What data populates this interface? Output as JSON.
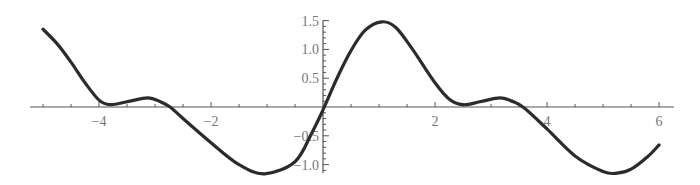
{
  "chart_data": {
    "type": "line",
    "title": "",
    "xlabel": "",
    "ylabel": "",
    "xlim": [
      -5,
      6
    ],
    "ylim": [
      -1.15,
      1.5
    ],
    "grid": false,
    "legend": null,
    "x_ticks": [
      -4,
      -2,
      2,
      4,
      6
    ],
    "x_tick_labels": [
      "−4",
      "−2",
      "2",
      "4",
      "6"
    ],
    "y_ticks": [
      -1.0,
      -0.5,
      0.5,
      1.0,
      1.5
    ],
    "y_tick_labels": [
      "−1.0",
      "−0.5",
      "0.5",
      "1.0",
      "1.5"
    ],
    "series": [
      {
        "name": "f(x)",
        "color": "#2b2b2b",
        "x": [
          -5.0,
          -4.75,
          -4.5,
          -4.25,
          -4.0,
          -3.8,
          -3.5,
          -3.13,
          -2.9,
          -2.73,
          -2.5,
          -2.0,
          -1.5,
          -1.04,
          -0.5,
          -0.2,
          0.0,
          0.25,
          0.5,
          0.75,
          1.05,
          1.3,
          1.6,
          2.0,
          2.25,
          2.5,
          2.8,
          3.16,
          3.4,
          3.6,
          4.0,
          4.5,
          5.0,
          5.25,
          5.5,
          5.8,
          6.0
        ],
        "y": [
          1.35,
          1.1,
          0.78,
          0.42,
          0.12,
          0.04,
          0.09,
          0.16,
          0.09,
          0.0,
          -0.2,
          -0.62,
          -1.0,
          -1.16,
          -0.95,
          -0.45,
          -0.05,
          0.5,
          0.98,
          1.33,
          1.48,
          1.38,
          1.0,
          0.42,
          0.14,
          0.04,
          0.09,
          0.16,
          0.09,
          -0.02,
          -0.38,
          -0.85,
          -1.12,
          -1.15,
          -1.08,
          -0.86,
          -0.66
        ]
      }
    ]
  }
}
